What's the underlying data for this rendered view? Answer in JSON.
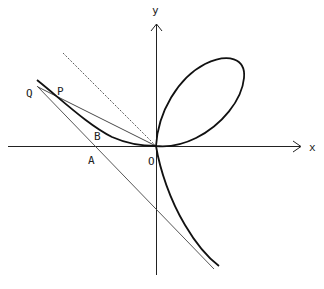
{
  "figure": {
    "type": "folium-of-descartes",
    "labels": {
      "x_axis": "x",
      "y_axis": "y",
      "origin": "O",
      "point_p": "P",
      "point_q": "Q",
      "point_a": "A",
      "point_b": "B"
    },
    "colors": {
      "curve": "#111111",
      "axis": "#222222",
      "line": "#444444",
      "background": "#ffffff"
    }
  }
}
